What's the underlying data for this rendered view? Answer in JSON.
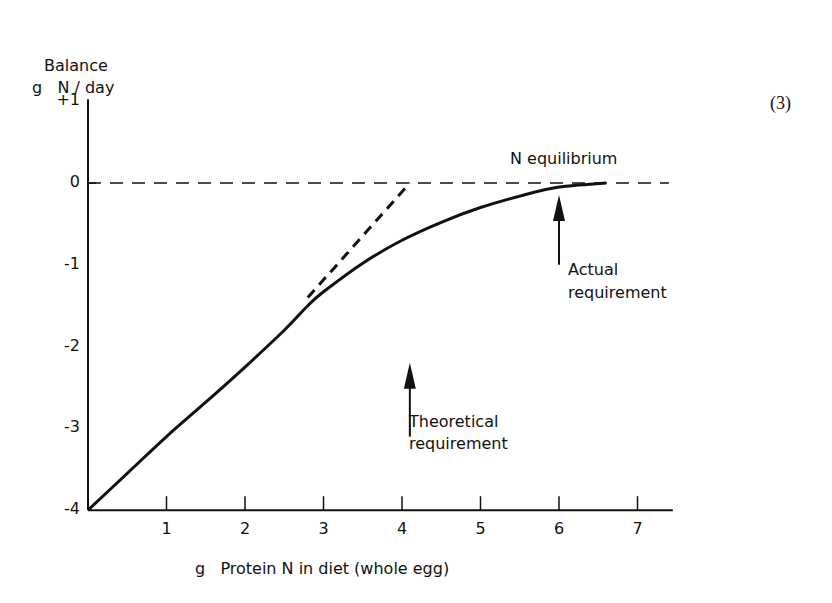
{
  "figure": {
    "equation_number": "(3)"
  },
  "chart_data": {
    "type": "line",
    "title": "",
    "ylabel_line1": "Balance",
    "ylabel_line2": "g   N / day",
    "xlabel": "g   Protein N in diet (whole egg)",
    "x_ticks": [
      1,
      2,
      3,
      4,
      5,
      6,
      7
    ],
    "x_tick_labels": [
      "1",
      "2",
      "3",
      "4",
      "5",
      "6",
      "7"
    ],
    "y_ticks": [
      1,
      0,
      -1,
      -2,
      -3,
      -4
    ],
    "y_tick_labels": [
      "+1",
      "0",
      "-1",
      "-2",
      "-3",
      "-4"
    ],
    "xlim": [
      0,
      7.5
    ],
    "ylim": [
      -4,
      1
    ],
    "grid": false,
    "series": [
      {
        "name": "Observed balance (solid curve)",
        "style": "solid",
        "x": [
          0,
          0.5,
          1,
          1.5,
          2,
          2.5,
          2.8,
          3,
          3.5,
          4,
          4.5,
          5,
          5.5,
          6,
          6.6
        ],
        "y": [
          -4,
          -3.55,
          -3.1,
          -2.68,
          -2.25,
          -1.8,
          -1.5,
          -1.33,
          -0.98,
          -0.7,
          -0.48,
          -0.3,
          -0.16,
          -0.05,
          0
        ]
      },
      {
        "name": "Theoretical linear extrapolation (dashed)",
        "style": "dashed",
        "x": [
          2.8,
          4.1
        ],
        "y": [
          -1.4,
          0
        ]
      },
      {
        "name": "N equilibrium",
        "style": "dashed",
        "x": [
          0,
          7.4
        ],
        "y": [
          0,
          0
        ]
      }
    ],
    "annotations": [
      {
        "text": "N equilibrium",
        "x": 5.2,
        "y": 0.15
      },
      {
        "text": "Actual requirement",
        "arrow_x": 6.0,
        "arrow_tip_y": -0.05,
        "arrow_tail_y": -1.0
      },
      {
        "text": "Theoretical requirement",
        "arrow_x": 4.1,
        "arrow_tip_y": -2.1,
        "arrow_tail_y": -3.1
      }
    ]
  },
  "labels": {
    "n_equilibrium": "N equilibrium",
    "actual_line1": "Actual",
    "actual_line2": "requirement",
    "theoretical_line1": "Theoretical",
    "theoretical_line2": "requirement"
  }
}
